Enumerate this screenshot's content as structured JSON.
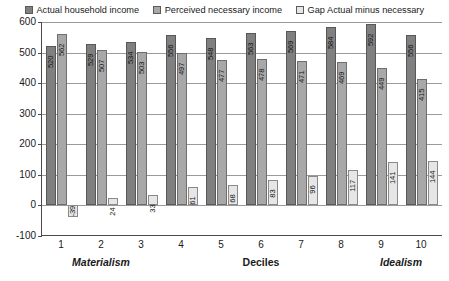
{
  "chart_data": {
    "type": "bar",
    "title": "",
    "xlabel": "Deciles",
    "ylabel": "",
    "ylim": [
      -100,
      600
    ],
    "ytick_values": [
      600,
      500,
      400,
      300,
      200,
      100,
      0,
      -100
    ],
    "ytick_labels": [
      "600",
      "500",
      "400",
      "300",
      "200",
      "100",
      "0",
      "-100"
    ],
    "grid": true,
    "legend_position": "top",
    "categories": [
      "1",
      "2",
      "3",
      "4",
      "5",
      "6",
      "7",
      "8",
      "9",
      "10"
    ],
    "series": [
      {
        "name": "Actual household income",
        "color": "#808080",
        "values": [
          520,
          529,
          534,
          556,
          548,
          563,
          569,
          584,
          592,
          556
        ]
      },
      {
        "name": "Perceived necessary income",
        "color": "#a8a8a8",
        "values": [
          562,
          507,
          503,
          497,
          477,
          478,
          471,
          469,
          449,
          415
        ]
      },
      {
        "name": "Gap Actual minus necessary",
        "color": "#e6e6e6",
        "values": [
          -39,
          24,
          33,
          61,
          68,
          83,
          96,
          117,
          141,
          144
        ]
      }
    ],
    "axis_captions": [
      {
        "text": "Materialism",
        "position": 1.5,
        "italic": true
      },
      {
        "text": "Deciles",
        "position": 5.5,
        "italic": false
      },
      {
        "text": "Idealism",
        "position": 9.0,
        "italic": true
      }
    ]
  },
  "legend": {
    "entries": [
      {
        "label": "Actual household income",
        "swatch": "#808080"
      },
      {
        "label": "Perceived necessary income",
        "swatch": "#a8a8a8"
      },
      {
        "label": "Gap Actual minus necessary",
        "swatch": "#e6e6e6"
      }
    ]
  }
}
